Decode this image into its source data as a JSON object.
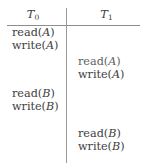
{
  "figure": {
    "name": "transaction-schedule",
    "columns": [
      {
        "id": "T0",
        "label": "T",
        "subscript": "0"
      },
      {
        "id": "T1",
        "label": "T",
        "subscript": "1"
      }
    ]
  },
  "schedule": {
    "left_column": [
      {
        "op": "read",
        "arg": "A",
        "text": "read(A)",
        "top": 27
      },
      {
        "op": "write",
        "arg": "A",
        "text": "write(A)",
        "top": 40
      },
      {
        "op": "read",
        "arg": "B",
        "text": "read(B)",
        "top": 88
      },
      {
        "op": "write",
        "arg": "B",
        "text": "write(B)",
        "top": 101
      }
    ],
    "right_column": [
      {
        "op": "read",
        "arg": "A",
        "text": "read(A)",
        "top": 56
      },
      {
        "op": "write",
        "arg": "A",
        "text": "write(A)",
        "top": 69
      },
      {
        "op": "read",
        "arg": "B",
        "text": "read(B)",
        "top": 128
      },
      {
        "op": "write",
        "arg": "B",
        "text": "write(B)",
        "top": 141
      }
    ]
  },
  "cells": {
    "t0_read_a": "read(A)",
    "t0_write_a": "write(A)",
    "t0_read_b": "read(B)",
    "t0_write_b": "write(B)",
    "t1_read_a": "read(A)",
    "t1_write_a": "write(A)",
    "t1_read_b": "read(B)",
    "t1_write_b": "write(B)"
  },
  "header": {
    "t0_base": "T",
    "t0_sub": "0",
    "t1_base": "T",
    "t1_sub": "1"
  },
  "colors": {
    "text": "#3d3d3d",
    "rule": "#8d8d8d",
    "background": "#ffffff"
  }
}
